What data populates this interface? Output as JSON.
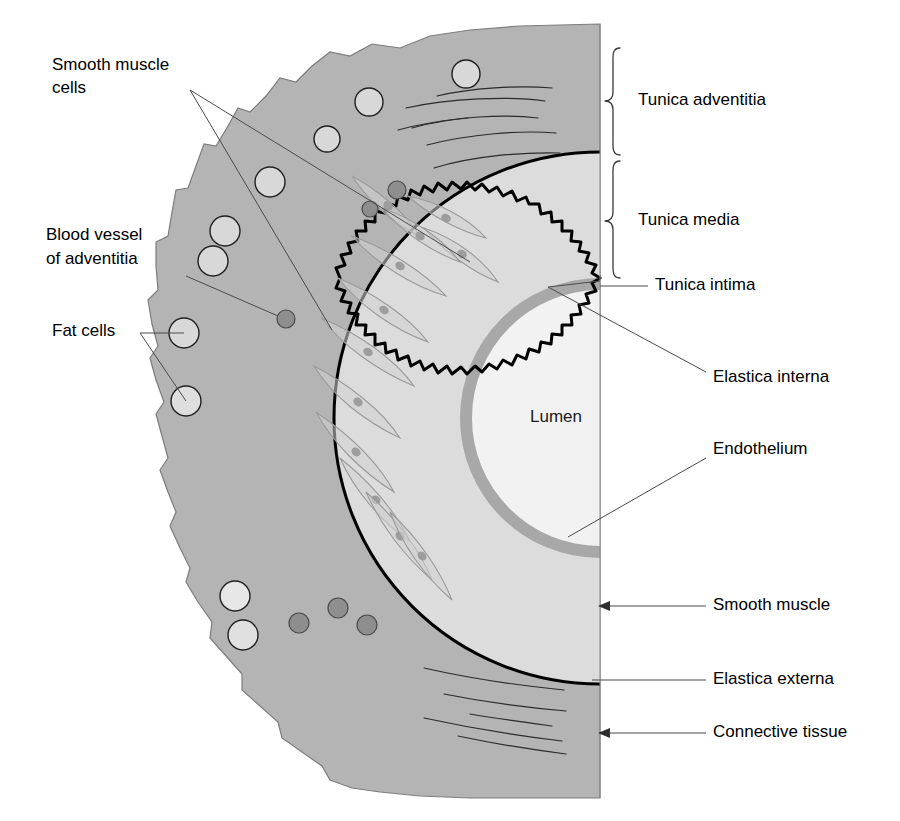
{
  "figure": {
    "lumen_label": "Lumen"
  },
  "colors": {
    "adventitia_fill": "#b4b4b4",
    "media_fill": "#dcdcdc",
    "intima_fill": "#a8a8a8",
    "lumen_fill": "#f2f2f2",
    "outline": "#6e6e6e",
    "elastica_externa": "#000000",
    "elastica_interna": "#000000",
    "fat_cell_fill": "#d8d8d8",
    "blood_vessel_fill": "#8e8e8e",
    "leader_line": "#4a4a4a",
    "text": "#000000",
    "background": "#ffffff"
  },
  "left_labels": [
    {
      "id": "smooth-muscle-cells",
      "line1": "Smooth muscle",
      "line2": "cells",
      "x": 52,
      "y1": 66,
      "y2": 89
    },
    {
      "id": "blood-vessel-of-adventitia",
      "line1": "Blood vessel",
      "line2": "of adventitia",
      "x": 46,
      "y1": 236,
      "y2": 260
    },
    {
      "id": "fat-cells",
      "line1": "Fat cells",
      "line2": "",
      "x": 52,
      "y1": 332,
      "y2": 0
    }
  ],
  "right_labels": [
    {
      "id": "tunica-adventitia",
      "text": "Tunica adventitia",
      "x": 638,
      "y": 101,
      "connector": "brace"
    },
    {
      "id": "tunica-media",
      "text": "Tunica media",
      "x": 638,
      "y": 221,
      "connector": "brace"
    },
    {
      "id": "tunica-intima",
      "text": "Tunica intima",
      "x": 655,
      "y": 286,
      "connector": "line"
    },
    {
      "id": "elastica-interna",
      "text": "Elastica interna",
      "x": 713,
      "y": 378,
      "connector": "leader"
    },
    {
      "id": "endothelium",
      "text": "Endothelium",
      "x": 713,
      "y": 450,
      "connector": "leader"
    },
    {
      "id": "smooth-muscle",
      "text": "Smooth muscle",
      "x": 713,
      "y": 606,
      "connector": "arrow"
    },
    {
      "id": "elastica-externa",
      "text": "Elastica externa",
      "x": 713,
      "y": 680,
      "connector": "line"
    },
    {
      "id": "connective-tissue",
      "text": "Connective tissue",
      "x": 713,
      "y": 733,
      "connector": "arrow"
    }
  ],
  "braces": [
    {
      "id": "brace-adventitia",
      "x": 612,
      "top": 48,
      "bottom": 155,
      "tip_y": 101
    },
    {
      "id": "brace-media",
      "x": 612,
      "top": 161,
      "bottom": 278,
      "tip_y": 221
    }
  ],
  "fat_cells": [
    {
      "cx": 466,
      "cy": 74,
      "r": 14
    },
    {
      "cx": 369,
      "cy": 102,
      "r": 14
    },
    {
      "cx": 327,
      "cy": 139,
      "r": 13
    },
    {
      "cx": 270,
      "cy": 182,
      "r": 15
    },
    {
      "cx": 225,
      "cy": 231,
      "r": 15
    },
    {
      "cx": 213,
      "cy": 261,
      "r": 15
    },
    {
      "cx": 184,
      "cy": 333,
      "r": 15
    },
    {
      "cx": 186,
      "cy": 401,
      "r": 15
    },
    {
      "cx": 235,
      "cy": 596,
      "r": 15
    },
    {
      "cx": 243,
      "cy": 635,
      "r": 15
    }
  ],
  "blood_vessels": [
    {
      "cx": 397,
      "cy": 190,
      "r": 9
    },
    {
      "cx": 370,
      "cy": 209,
      "r": 8
    },
    {
      "cx": 286,
      "cy": 319,
      "r": 9
    },
    {
      "cx": 299,
      "cy": 623,
      "r": 10
    },
    {
      "cx": 338,
      "cy": 608,
      "r": 10
    },
    {
      "cx": 367,
      "cy": 625,
      "r": 10
    }
  ],
  "connective_fibers_count": 11,
  "smooth_muscle_cell_count": 12,
  "geometry": {
    "cut_edge_x": 600,
    "lumen_center_x": 600,
    "lumen_center_y": 418,
    "lumen_radius": 128,
    "intima_radius": 140,
    "media_outer_radius": 222,
    "adventitia_base_radius": 320
  }
}
